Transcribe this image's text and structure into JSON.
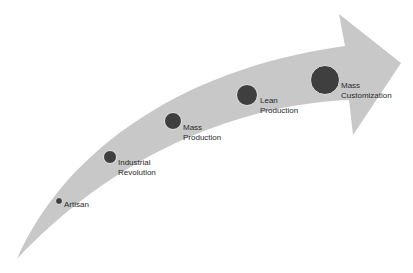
{
  "diagram": {
    "type": "curved-arrow-timeline",
    "arrow_color": "#c8c8c8",
    "marker_color": "#3f3f3f",
    "stages": [
      {
        "label": "Artisan",
        "cx": 59,
        "cy": 201,
        "r": 4,
        "lx": 64,
        "ly": 200
      },
      {
        "label": "Industrial\nRevolution",
        "cx": 110,
        "cy": 157,
        "r": 7,
        "lx": 118,
        "ly": 158
      },
      {
        "label": "Mass\nProduction",
        "cx": 173,
        "cy": 121,
        "r": 9,
        "lx": 183,
        "ly": 123
      },
      {
        "label": "Lean\nProduction",
        "cx": 247,
        "cy": 95,
        "r": 11,
        "lx": 260,
        "ly": 96
      },
      {
        "label": "Mass\nCustomization",
        "cx": 325,
        "cy": 80,
        "r": 15,
        "lx": 341,
        "ly": 81
      }
    ]
  }
}
